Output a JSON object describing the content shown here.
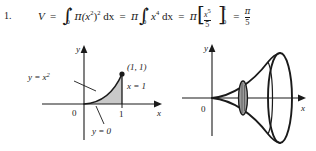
{
  "problem": {
    "number": "1.",
    "formula": {
      "lhs": "V",
      "equals": "=",
      "term1": {
        "integral_lower": "0",
        "integral_upper": "1",
        "pi": "π",
        "integrand": "(x",
        "inner_exp": "2",
        "close": ")",
        "outer_exp": "2",
        "differential": "dx"
      },
      "term2": {
        "pi": "π",
        "integral_lower": "0",
        "integral_upper": "1",
        "var": "x",
        "exp": "4",
        "differential": "dx"
      },
      "term3": {
        "pi": "π",
        "bracket_left": "[",
        "bracket_right": "]",
        "numerator_var": "x",
        "numerator_exp": "5",
        "denominator": "5",
        "limit_upper": "1",
        "limit_lower": "0"
      },
      "result": {
        "numerator": "π",
        "denominator": "5"
      }
    }
  },
  "figure_region": {
    "name": "region-under-parabola",
    "axis_x_label": "x",
    "axis_y_label": "y",
    "origin_label": "0",
    "tick_x_label": "1",
    "curve_label": "y = x²",
    "curve_label_plain": "y = x",
    "curve_label_exp": "2",
    "point_label": "(1, 1)",
    "boundary_right_label": "x = 1",
    "boundary_bottom_label": "y = 0",
    "shade_color": "#c9c9c9",
    "line_color": "#1a1a1a"
  },
  "figure_solid": {
    "name": "solid-of-revolution",
    "axis_x_label": "x",
    "axis_y_label": "y",
    "origin_label": "0",
    "disk_shade_color": "#9a9a9a",
    "line_color": "#1a1a1a"
  },
  "colors": {
    "background": "#ffffff",
    "ink": "#1a1a1a",
    "shade": "#c9c9c9"
  }
}
